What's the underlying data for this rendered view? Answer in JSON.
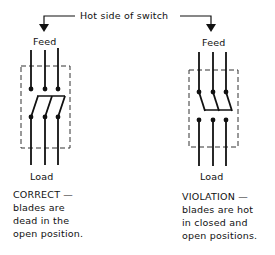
{
  "header": {
    "label": "Hot side of switch"
  },
  "left_switch": {
    "top_label": "Feed",
    "bottom_label": "Load",
    "caption_title": "CORRECT —",
    "caption_lines": [
      "blades are",
      "dead in the",
      "open position."
    ]
  },
  "right_switch": {
    "top_label": "Feed",
    "bottom_label": "Load",
    "caption_title": "VIOLATION —",
    "caption_lines": [
      "blades are hot",
      "in closed and",
      "open positions."
    ]
  },
  "colors": {
    "ink": "#111111",
    "background": "#ffffff"
  }
}
